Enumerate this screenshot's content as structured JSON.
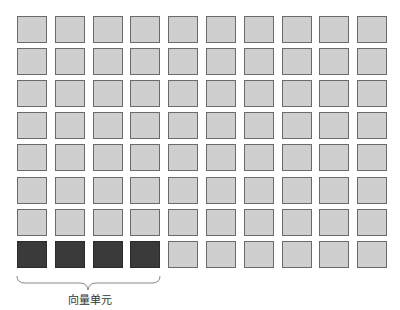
{
  "diagram": {
    "rows": 8,
    "cols": 10,
    "highlighted": {
      "row": 7,
      "cols": [
        0,
        1,
        2,
        3
      ]
    },
    "label": "向量单元",
    "colors": {
      "cell_fill": "#cfcfcf",
      "cell_border": "#6b6b6b",
      "highlight_fill": "#3a3a3a"
    }
  }
}
